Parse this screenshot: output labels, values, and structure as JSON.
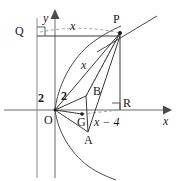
{
  "figure": {
    "colors": {
      "stroke": "#3a3a3a",
      "dashed": "#9a9a9a",
      "axis": "#6b6b6b",
      "text": "#1a1a1a",
      "background": "#ffffff"
    },
    "axes": {
      "x_label": "x",
      "y_label": "y"
    },
    "points": {
      "origin": "O",
      "p": "P",
      "q": "Q",
      "a": "A",
      "b": "B",
      "g": "G",
      "r": "R"
    },
    "measures": {
      "seg_q_to_p": "x",
      "seg_b_to_p": "x",
      "seg_left_two": "2",
      "seg_right_two": "2",
      "seg_horizontal": "x − 4"
    }
  }
}
